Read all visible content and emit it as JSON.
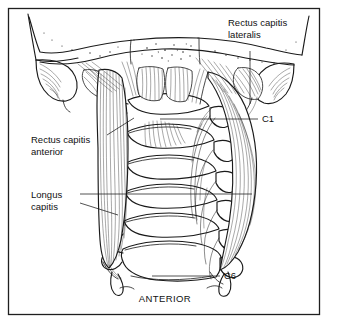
{
  "figure": {
    "caption": "ANTERIOR",
    "border_color": "#1f1f1f",
    "ink_color": "#1a1a1a",
    "background_color": "#ffffff",
    "shade_color": "#b9b9b9"
  },
  "labels": [
    {
      "id": "rectus-capitis-lateralis",
      "line1": "Rectus capitis",
      "line2": "lateralis",
      "text_x": 228,
      "text_y": 26,
      "anchor": "start"
    },
    {
      "id": "rectus-capitis-anterior",
      "line1": "Rectus capitis",
      "line2": "anterior",
      "text_x": 31,
      "text_y": 143,
      "anchor": "start"
    },
    {
      "id": "longus-capitis",
      "line1": "Longus",
      "line2": "capitis",
      "text_x": 31,
      "text_y": 198,
      "anchor": "start"
    }
  ],
  "vertebra_labels": [
    {
      "id": "c1",
      "text": "C1",
      "x": 262,
      "y": 122
    },
    {
      "id": "c6",
      "text": "C6",
      "x": 224,
      "y": 279
    }
  ],
  "anatomy": {
    "structures": [
      "occipital bone / skull base",
      "mastoid process (left)",
      "mastoid process (right)",
      "cervical vertebral bodies C1 through C6",
      "transverse processes",
      "rectus capitis lateralis muscle",
      "rectus capitis anterior muscle",
      "longus capitis muscle (left)",
      "longus capitis muscle (right)"
    ],
    "vertebra_count": 6
  }
}
